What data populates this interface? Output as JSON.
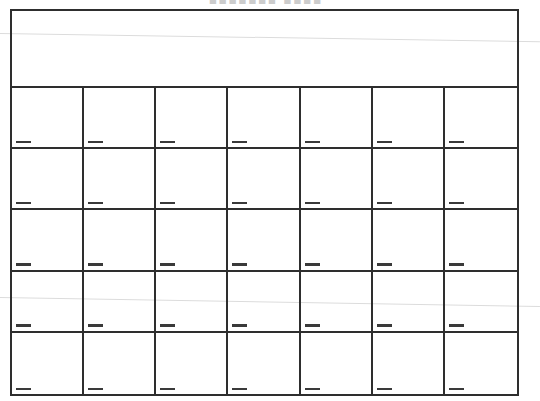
{
  "title": {
    "cropped_text": "■■■■■■■ ■■■■",
    "note": "bold title cut off at top edge of scan; only bottom sliver of glyphs visible, illegible"
  },
  "calendar": {
    "header_band_text": "",
    "grid": {
      "columns": 7,
      "rows": 5,
      "cell_count": 35,
      "date_line_marks_per_cell": 1
    }
  },
  "colors": {
    "background": "#ffffff",
    "grid_line": "#2e2e2e",
    "date_line": "#3a3a3a",
    "scan_artifact_line": "#dcdcdc",
    "cropped_title": "#cccccc"
  }
}
